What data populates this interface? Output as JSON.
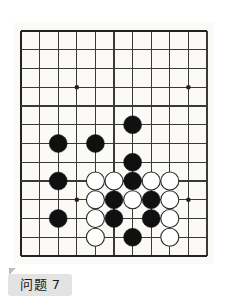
{
  "page": {
    "background_color": "#ffffff",
    "caption": "问题 7",
    "caption_background": "#e3e3e3",
    "caption_text_color": "#1a1a1a"
  },
  "board": {
    "type": "go-board",
    "description": "Go (weiqi) problem diagram, partial board view of upper-left/lower area",
    "paper_color": "#fbfaf6",
    "line_color": "#3a3a3a",
    "edge_line_color": "#222222",
    "black_stone_color": "#101010",
    "white_stone_color": "#ffffff",
    "white_stone_border": "#2b2b2b",
    "columns": 11,
    "rows": 13,
    "origin_x": 21,
    "origin_y": 31,
    "cell_w": 18.6,
    "cell_h": 18.75,
    "stone_radius": 9.0,
    "star_points": [
      {
        "col": 3,
        "row": 3
      },
      {
        "col": 9,
        "row": 3
      },
      {
        "col": 3,
        "row": 9
      },
      {
        "col": 9,
        "row": 9
      }
    ],
    "stones": [
      {
        "col": 6,
        "row": 5,
        "color": "black"
      },
      {
        "col": 2,
        "row": 6,
        "color": "black"
      },
      {
        "col": 4,
        "row": 6,
        "color": "black"
      },
      {
        "col": 6,
        "row": 7,
        "color": "black"
      },
      {
        "col": 2,
        "row": 8,
        "color": "black"
      },
      {
        "col": 4,
        "row": 8,
        "color": "white"
      },
      {
        "col": 5,
        "row": 8,
        "color": "white"
      },
      {
        "col": 6,
        "row": 8,
        "color": "black"
      },
      {
        "col": 7,
        "row": 8,
        "color": "white"
      },
      {
        "col": 8,
        "row": 8,
        "color": "white"
      },
      {
        "col": 4,
        "row": 9,
        "color": "white"
      },
      {
        "col": 5,
        "row": 9,
        "color": "black"
      },
      {
        "col": 6,
        "row": 9,
        "color": "white"
      },
      {
        "col": 7,
        "row": 9,
        "color": "black"
      },
      {
        "col": 8,
        "row": 9,
        "color": "white"
      },
      {
        "col": 2,
        "row": 10,
        "color": "black"
      },
      {
        "col": 4,
        "row": 10,
        "color": "white"
      },
      {
        "col": 5,
        "row": 10,
        "color": "black"
      },
      {
        "col": 7,
        "row": 10,
        "color": "black"
      },
      {
        "col": 8,
        "row": 10,
        "color": "white"
      },
      {
        "col": 4,
        "row": 11,
        "color": "white"
      },
      {
        "col": 6,
        "row": 11,
        "color": "black"
      },
      {
        "col": 8,
        "row": 11,
        "color": "white"
      }
    ]
  }
}
